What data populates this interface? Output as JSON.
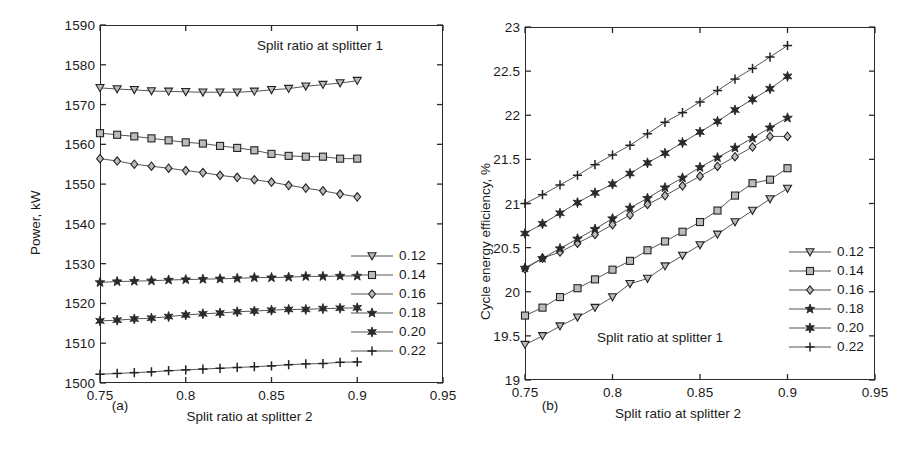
{
  "figure": {
    "panels": [
      {
        "caption": "(a)",
        "xlabel": "Split ratio at splitter 2",
        "ylabel": "Power, kW",
        "annotation": "Split ratio at splitter 1",
        "legend_title": "Split ratio at splitter 1"
      },
      {
        "caption": "(b)",
        "xlabel": "Split ratio at splitter 2",
        "ylabel": "Cycle energy efficiency, %",
        "annotation": "Split ratio at splitter 1",
        "legend_title": "Split ratio at splitter 1"
      }
    ]
  },
  "chart_data": [
    {
      "type": "line",
      "panel": "(a)",
      "title": "",
      "annotation": "Split ratio at splitter 1",
      "xlabel": "Split ratio at splitter 2",
      "ylabel": "Power, kW",
      "xlim": [
        0.75,
        0.95
      ],
      "ylim": [
        1500,
        1590
      ],
      "xticks": [
        0.75,
        0.8,
        0.85,
        0.9,
        0.95
      ],
      "xtick_labels": [
        "0.75",
        "0.8",
        "0.85",
        "0.9",
        "0.95"
      ],
      "yticks": [
        1500,
        1510,
        1520,
        1530,
        1540,
        1550,
        1560,
        1570,
        1580,
        1590
      ],
      "ytick_labels": [
        "1500",
        "1510",
        "1520",
        "1530",
        "1540",
        "1550",
        "1560",
        "1570",
        "1580",
        "1590"
      ],
      "grid": false,
      "legend_position": "right-middle",
      "x": [
        0.75,
        0.76,
        0.77,
        0.78,
        0.79,
        0.8,
        0.81,
        0.82,
        0.83,
        0.84,
        0.85,
        0.86,
        0.87,
        0.88,
        0.89,
        0.9
      ],
      "series": [
        {
          "name": "0.12",
          "marker": "triangle-down",
          "values": [
            1574.2,
            1573.9,
            1573.7,
            1573.4,
            1573.3,
            1573.2,
            1573.1,
            1573.1,
            1573.1,
            1573.3,
            1573.7,
            1574.0,
            1574.6,
            1575.0,
            1575.4,
            1576.0
          ]
        },
        {
          "name": "0.14",
          "marker": "square",
          "values": [
            1562.8,
            1562.4,
            1562.0,
            1561.5,
            1561.0,
            1560.5,
            1560.2,
            1559.6,
            1559.1,
            1558.5,
            1557.6,
            1557.1,
            1556.9,
            1556.9,
            1556.4,
            1556.4
          ]
        },
        {
          "name": "0.16",
          "marker": "diamond",
          "values": [
            1556.4,
            1555.8,
            1555.0,
            1554.5,
            1554.0,
            1553.4,
            1552.9,
            1552.2,
            1551.7,
            1551.1,
            1550.5,
            1549.7,
            1549.0,
            1548.3,
            1547.5,
            1546.8
          ]
        },
        {
          "name": "0.18",
          "marker": "pentagram",
          "values": [
            1525.3,
            1525.5,
            1525.6,
            1525.7,
            1525.9,
            1526.0,
            1526.1,
            1526.2,
            1526.3,
            1526.5,
            1526.5,
            1526.6,
            1526.8,
            1526.8,
            1526.9,
            1526.9
          ]
        },
        {
          "name": "0.20",
          "marker": "hexagram",
          "values": [
            1515.6,
            1515.8,
            1516.1,
            1516.3,
            1516.7,
            1517.1,
            1517.4,
            1517.6,
            1517.9,
            1518.1,
            1518.3,
            1518.5,
            1518.5,
            1518.7,
            1518.8,
            1518.9
          ]
        },
        {
          "name": "0.22",
          "marker": "plus",
          "values": [
            1502.2,
            1502.4,
            1502.6,
            1502.8,
            1503.1,
            1503.3,
            1503.5,
            1503.7,
            1503.9,
            1504.1,
            1504.3,
            1504.6,
            1504.8,
            1504.9,
            1505.2,
            1505.3
          ]
        }
      ]
    },
    {
      "type": "line",
      "panel": "(b)",
      "title": "",
      "annotation": "Split ratio at splitter 1",
      "xlabel": "Split ratio at splitter 2",
      "ylabel": "Cycle energy efficiency, %",
      "xlim": [
        0.75,
        0.95
      ],
      "ylim": [
        19,
        23
      ],
      "xticks": [
        0.75,
        0.8,
        0.85,
        0.9,
        0.95
      ],
      "xtick_labels": [
        "0.75",
        "0.8",
        "0.85",
        "0.9",
        "0.95"
      ],
      "yticks": [
        19,
        19.5,
        20,
        20.5,
        21,
        21.5,
        22,
        22.5,
        23
      ],
      "ytick_labels": [
        "19",
        "19.5",
        "20",
        "20.5",
        "21",
        "21.5",
        "22",
        "22.5",
        "23"
      ],
      "grid": false,
      "legend_position": "right-middle",
      "x": [
        0.75,
        0.76,
        0.77,
        0.78,
        0.79,
        0.8,
        0.81,
        0.82,
        0.83,
        0.84,
        0.85,
        0.86,
        0.87,
        0.88,
        0.89,
        0.9
      ],
      "series": [
        {
          "name": "0.12",
          "marker": "triangle-down",
          "values": [
            19.4,
            19.5,
            19.61,
            19.71,
            19.82,
            19.94,
            20.09,
            20.15,
            20.29,
            20.41,
            20.53,
            20.65,
            20.79,
            20.92,
            21.05,
            21.17
          ]
        },
        {
          "name": "0.14",
          "marker": "square",
          "values": [
            19.73,
            19.82,
            19.94,
            20.04,
            20.14,
            20.25,
            20.35,
            20.47,
            20.57,
            20.68,
            20.79,
            20.92,
            21.09,
            21.23,
            21.27,
            21.4
          ]
        },
        {
          "name": "0.16",
          "marker": "diamond",
          "values": [
            20.26,
            20.38,
            20.45,
            20.55,
            20.65,
            20.76,
            20.87,
            20.99,
            21.09,
            21.2,
            21.31,
            21.42,
            21.53,
            21.64,
            21.76,
            21.76
          ]
        },
        {
          "name": "0.18",
          "marker": "pentagram",
          "values": [
            20.27,
            20.38,
            20.49,
            20.6,
            20.71,
            20.83,
            20.95,
            21.06,
            21.18,
            21.29,
            21.41,
            21.52,
            21.63,
            21.74,
            21.86,
            21.97
          ]
        },
        {
          "name": "0.20",
          "marker": "hexagram",
          "values": [
            20.66,
            20.77,
            20.89,
            21.01,
            21.12,
            21.22,
            21.34,
            21.46,
            21.57,
            21.69,
            21.81,
            21.93,
            22.06,
            22.18,
            22.3,
            22.44
          ]
        },
        {
          "name": "0.22",
          "marker": "plus",
          "values": [
            21.0,
            21.1,
            21.21,
            21.32,
            21.44,
            21.55,
            21.66,
            21.79,
            21.92,
            22.03,
            22.15,
            22.28,
            22.41,
            22.53,
            22.66,
            22.79
          ]
        }
      ]
    }
  ],
  "legend": {
    "entries": [
      {
        "label": "0.12",
        "marker": "triangle-down"
      },
      {
        "label": "0.14",
        "marker": "square"
      },
      {
        "label": "0.16",
        "marker": "diamond"
      },
      {
        "label": "0.18",
        "marker": "pentagram"
      },
      {
        "label": "0.20",
        "marker": "hexagram"
      },
      {
        "label": "0.22",
        "marker": "plus"
      }
    ]
  },
  "colors": {
    "axis": "#2b2b2b",
    "line": "#555555",
    "marker_stroke": "#222222",
    "marker_fill": "#bbbbbb",
    "text": "#1a1a1a",
    "background": "#ffffff"
  }
}
